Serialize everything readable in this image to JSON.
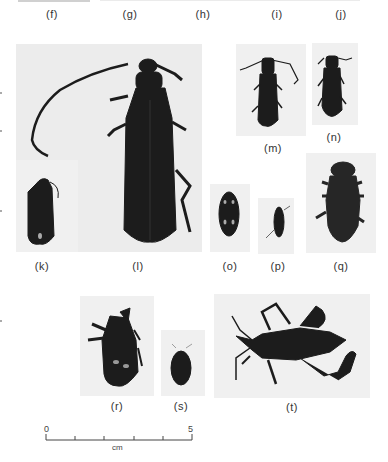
{
  "figure": {
    "panels": [
      {
        "id": "f",
        "label": "(f)"
      },
      {
        "id": "g",
        "label": "(g)"
      },
      {
        "id": "h",
        "label": "(h)"
      },
      {
        "id": "i",
        "label": "(i)"
      },
      {
        "id": "j",
        "label": "(j)"
      },
      {
        "id": "k",
        "label": "(k)"
      },
      {
        "id": "l",
        "label": "(l)"
      },
      {
        "id": "m",
        "label": "(m)"
      },
      {
        "id": "n",
        "label": "(n)"
      },
      {
        "id": "o",
        "label": "(o)"
      },
      {
        "id": "p",
        "label": "(p)"
      },
      {
        "id": "q",
        "label": "(q)"
      },
      {
        "id": "r",
        "label": "(r)"
      },
      {
        "id": "s",
        "label": "(s)"
      },
      {
        "id": "t",
        "label": "(t)"
      }
    ],
    "scale_bar": {
      "start_label": "0",
      "end_label": "5",
      "unit": "cm",
      "ticks": 6
    },
    "colors": {
      "background": "#ffffff",
      "plate": "#ececec",
      "specimen": "#1c1c1c",
      "text": "#333333"
    }
  }
}
